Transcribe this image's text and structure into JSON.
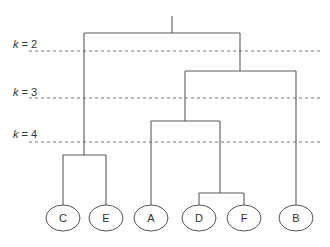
{
  "diagram": {
    "type": "dendrogram",
    "cut_lines": [
      {
        "label_var": "k",
        "label_rest": " = 2",
        "y": 51
      },
      {
        "label_var": "k",
        "label_rest": " = 3",
        "y": 98
      },
      {
        "label_var": "k",
        "label_rest": " = 4",
        "y": 142
      }
    ],
    "leaves": [
      {
        "id": "C",
        "label": "C",
        "x": 63
      },
      {
        "id": "E",
        "label": "E",
        "x": 106
      },
      {
        "id": "A",
        "label": "A",
        "x": 151
      },
      {
        "id": "D",
        "label": "D",
        "x": 199
      },
      {
        "id": "F",
        "label": "F",
        "x": 244
      },
      {
        "id": "B",
        "label": "B",
        "x": 296
      }
    ],
    "merges": [
      {
        "children": [
          "D",
          "F"
        ],
        "height_y": 193
      },
      {
        "children": [
          "C",
          "E"
        ],
        "height_y": 155
      },
      {
        "children": [
          "A",
          "DF"
        ],
        "height_y": 121
      },
      {
        "children": [
          "ADF",
          "B"
        ],
        "height_y": 71
      },
      {
        "children": [
          "CE",
          "ADFB"
        ],
        "height_y": 33
      }
    ],
    "colors": {
      "edge": "#5a5a5a",
      "cut_line": "#777777",
      "node_stroke": "#555555",
      "text": "#333333"
    }
  }
}
